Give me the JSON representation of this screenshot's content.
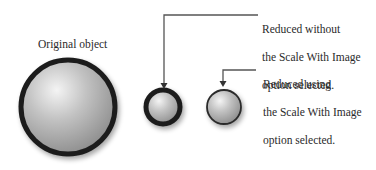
{
  "diagram": {
    "original_label": "Original object",
    "callouts": [
      {
        "id": "without-scale",
        "lines": [
          "Reduced without",
          "the Scale With Image",
          "option selected."
        ]
      },
      {
        "id": "with-scale",
        "lines": [
          "Reduced using",
          "the Scale With Image",
          "option selected."
        ]
      }
    ],
    "objects": [
      {
        "name": "original",
        "cx": 68,
        "cy": 107,
        "r": 48,
        "stroke_width": 5
      },
      {
        "name": "reduced-without-scale",
        "cx": 163,
        "cy": 107,
        "r": 18,
        "stroke_width": 5
      },
      {
        "name": "reduced-with-scale",
        "cx": 224,
        "cy": 107,
        "r": 17,
        "stroke_width": 2
      }
    ],
    "colors": {
      "stroke": "#1e1e1e",
      "sphere_light": "#f2f2f2",
      "sphere_dark": "#9a9a9a",
      "line": "#555555"
    }
  }
}
